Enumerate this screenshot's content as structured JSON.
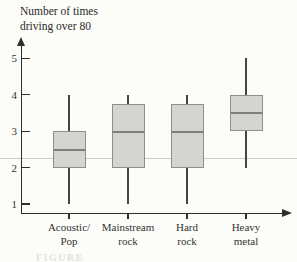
{
  "chart_data": {
    "type": "boxplot",
    "title": "Number of times driving over 80",
    "title_lines": [
      "Number of times",
      "driving over 80"
    ],
    "xlabel": "",
    "ylabel": "Number of times driving over 80",
    "ylim": [
      1,
      5
    ],
    "y_ticks": [
      1,
      2,
      3,
      4,
      5
    ],
    "grid": "off",
    "legend": "none",
    "reference_line_value": 2.25,
    "categories": [
      "Acoustic/Pop",
      "Mainstream rock",
      "Hard rock",
      "Heavy metal"
    ],
    "category_label_lines": [
      [
        "Acoustic/",
        "Pop"
      ],
      [
        "Mainstream",
        "rock"
      ],
      [
        "Hard",
        "rock"
      ],
      [
        "Heavy",
        "metal"
      ]
    ],
    "series": [
      {
        "name": "Acoustic/Pop",
        "min": 1,
        "q1": 2,
        "median": 2.5,
        "q3": 3,
        "max": 4
      },
      {
        "name": "Mainstream rock",
        "min": 1,
        "q1": 2,
        "median": 3,
        "q3": 3.75,
        "max": 4
      },
      {
        "name": "Hard rock",
        "min": 1,
        "q1": 2,
        "median": 3,
        "q3": 3.75,
        "max": 4
      },
      {
        "name": "Heavy metal",
        "min": 2,
        "q1": 3,
        "median": 3.5,
        "q3": 4,
        "max": 5
      }
    ],
    "colors": {
      "box_fill": "#d4d4d2",
      "box_border": "#8e8e8c",
      "median": "#7e7e7c",
      "whisker": "#454543",
      "axis": "#2e2e2c",
      "reference_line": "#cbcbc9",
      "background": "#fcfcf9"
    }
  },
  "caption": {
    "text": "FIGURE"
  }
}
